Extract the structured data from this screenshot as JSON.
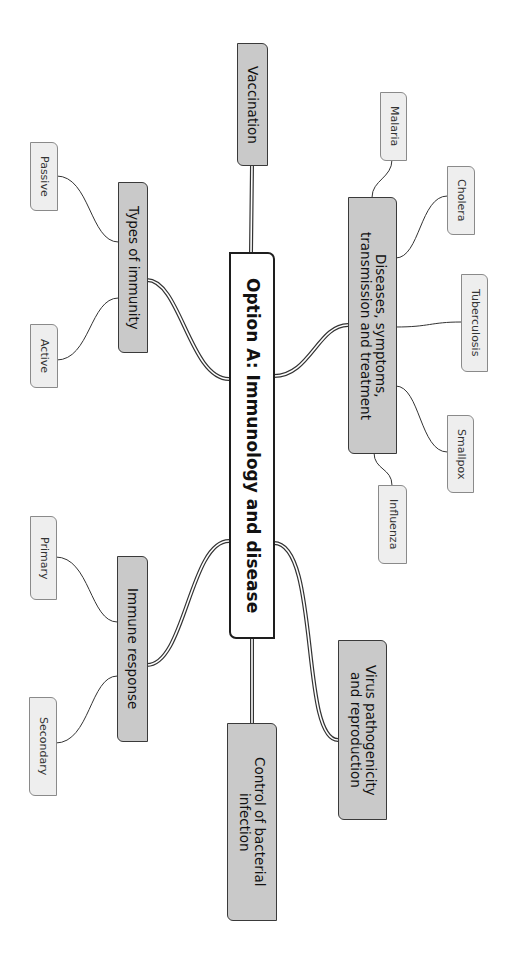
{
  "central": {
    "label": "Option A: Immunology and disease"
  },
  "branches": [
    {
      "id": "vaccination",
      "label": "Vaccination"
    },
    {
      "id": "diseases",
      "label": "Diseases, symptoms,\ntransmission and treatment"
    },
    {
      "id": "types",
      "label": "Types of immunity"
    },
    {
      "id": "immune",
      "label": "Immune response"
    },
    {
      "id": "virus",
      "label": "Virus pathogenicity\nand reproduction"
    },
    {
      "id": "control",
      "label": "Control of bacterial\ninfection"
    }
  ],
  "leaves": {
    "diseases": [
      "Malaria",
      "Cholera",
      "Tuberculosis",
      "Smallpox",
      "Influenza"
    ],
    "types": [
      "Passive",
      "Active"
    ],
    "immune": [
      "Primary",
      "Secondary"
    ]
  },
  "colors": {
    "central_fill": "#ffffff",
    "branch_fill": "#c9c9c9",
    "leaf_fill": "#eeeeee",
    "line": "#2a2a2a"
  }
}
